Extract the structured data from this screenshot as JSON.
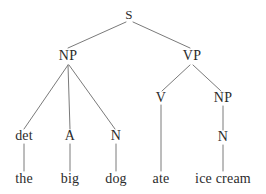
{
  "diagram": {
    "type": "syntax-tree",
    "sentence": "the big dog ate ice cream",
    "colors": {
      "background": "#ffffff",
      "text": "#2b2b2b",
      "edge": "#7a7a7a"
    },
    "nodes": [
      {
        "id": "S",
        "label": "S",
        "x": 129,
        "y": 14,
        "level": 0,
        "kind": "category"
      },
      {
        "id": "NP1",
        "label": "NP",
        "x": 68,
        "y": 56,
        "level": 1,
        "kind": "category"
      },
      {
        "id": "VP",
        "label": "VP",
        "x": 192,
        "y": 56,
        "level": 1,
        "kind": "category"
      },
      {
        "id": "det",
        "label": "det",
        "x": 24,
        "y": 136,
        "level": 2,
        "kind": "pos"
      },
      {
        "id": "A",
        "label": "A",
        "x": 70,
        "y": 136,
        "level": 2,
        "kind": "pos"
      },
      {
        "id": "N1",
        "label": "N",
        "x": 116,
        "y": 136,
        "level": 2,
        "kind": "pos"
      },
      {
        "id": "V",
        "label": "V",
        "x": 161,
        "y": 98,
        "level": 2,
        "kind": "pos"
      },
      {
        "id": "NP2",
        "label": "NP",
        "x": 223,
        "y": 98,
        "level": 2,
        "kind": "category"
      },
      {
        "id": "N2",
        "label": "N",
        "x": 223,
        "y": 137,
        "level": 3,
        "kind": "pos"
      },
      {
        "id": "the",
        "label": "the",
        "x": 24,
        "y": 179,
        "level": 4,
        "kind": "word"
      },
      {
        "id": "big",
        "label": "big",
        "x": 70,
        "y": 179,
        "level": 4,
        "kind": "word"
      },
      {
        "id": "dog",
        "label": "dog",
        "x": 116,
        "y": 179,
        "level": 4,
        "kind": "word"
      },
      {
        "id": "ate",
        "label": "ate",
        "x": 161,
        "y": 179,
        "level": 4,
        "kind": "word"
      },
      {
        "id": "icecream",
        "label": "ice cream",
        "x": 223,
        "y": 179,
        "level": 4,
        "kind": "word"
      }
    ],
    "edges": [
      {
        "from": "S",
        "to": "NP1",
        "x1": 126,
        "y1": 22,
        "x2": 68,
        "y2": 48
      },
      {
        "from": "S",
        "to": "VP",
        "x1": 133,
        "y1": 22,
        "x2": 190,
        "y2": 48
      },
      {
        "from": "NP1",
        "to": "det",
        "x1": 68,
        "y1": 65,
        "x2": 24,
        "y2": 129
      },
      {
        "from": "NP1",
        "to": "A",
        "x1": 68,
        "y1": 65,
        "x2": 70,
        "y2": 129
      },
      {
        "from": "NP1",
        "to": "N1",
        "x1": 69,
        "y1": 65,
        "x2": 115,
        "y2": 129
      },
      {
        "from": "VP",
        "to": "V",
        "x1": 190,
        "y1": 65,
        "x2": 162,
        "y2": 91
      },
      {
        "from": "VP",
        "to": "NP2",
        "x1": 193,
        "y1": 65,
        "x2": 221,
        "y2": 91
      },
      {
        "from": "det",
        "to": "the",
        "x1": 24,
        "y1": 144,
        "x2": 24,
        "y2": 171
      },
      {
        "from": "A",
        "to": "big",
        "x1": 70,
        "y1": 144,
        "x2": 70,
        "y2": 171
      },
      {
        "from": "N1",
        "to": "dog",
        "x1": 116,
        "y1": 144,
        "x2": 116,
        "y2": 171
      },
      {
        "from": "V",
        "to": "ate",
        "x1": 161,
        "y1": 105,
        "x2": 161,
        "y2": 171
      },
      {
        "from": "NP2",
        "to": "N2",
        "x1": 223,
        "y1": 106,
        "x2": 223,
        "y2": 130
      },
      {
        "from": "N2",
        "to": "icecream",
        "x1": 223,
        "y1": 145,
        "x2": 223,
        "y2": 171
      }
    ]
  }
}
